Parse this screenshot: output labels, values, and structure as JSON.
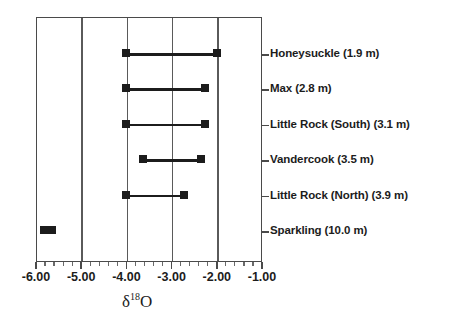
{
  "chart_data": {
    "type": "bar",
    "subtype": "horizontal-range",
    "title": "",
    "xlabel": "δ¹⁸O",
    "xlabel_base": "δ",
    "xlabel_superscript": "18",
    "xlabel_element": "O",
    "ylabel": "",
    "xlim": [
      -6.0,
      -1.0
    ],
    "xticks": [
      -6.0,
      -5.0,
      -4.0,
      -3.0,
      -2.0,
      -1.0
    ],
    "xtick_labels": [
      "-6.00",
      "-5.00",
      "-4.00",
      "-3.00",
      "-2.00",
      "-1.00"
    ],
    "minor_ticks_per_interval": 4,
    "grid": true,
    "grid_axis": "x",
    "legend": false,
    "categories": [
      "Honeysuckle (1.9 m)",
      "Max  (2.8 m)",
      "Little Rock (South) (3.1 m)",
      "Vandercook (3.5 m)",
      "Little Rock (North)  (3.9 m)",
      "Sparkling  (10.0 m)"
    ],
    "series": [
      {
        "name": "delta-18-O range",
        "ranges": [
          {
            "label": "Honeysuckle (1.9 m)",
            "lake": "Honeysuckle",
            "depth_m": 1.9,
            "min": -4.0,
            "max": -2.0
          },
          {
            "label": "Max  (2.8 m)",
            "lake": "Max",
            "depth_m": 2.8,
            "min": -4.0,
            "max": -2.27
          },
          {
            "label": "Little Rock (South) (3.1 m)",
            "lake": "Little Rock (South)",
            "depth_m": 3.1,
            "min": -4.0,
            "max": -2.27
          },
          {
            "label": "Vandercook (3.5 m)",
            "lake": "Vandercook",
            "depth_m": 3.5,
            "min": -3.64,
            "max": -2.36
          },
          {
            "label": "Little Rock (North)  (3.9 m)",
            "lake": "Little Rock (North)",
            "depth_m": 3.9,
            "min": -4.0,
            "max": -2.73
          },
          {
            "label": "Sparkling  (10.0 m)",
            "lake": "Sparkling",
            "depth_m": 10.0,
            "min": -5.82,
            "max": -5.64
          }
        ]
      }
    ],
    "colors": {
      "marker": "#1c1c1c",
      "line": "#1c1c1c",
      "frame": "#4a4a4a",
      "grid": "#5a5a5a",
      "text": "#1c1c1c",
      "background": "#ffffff"
    }
  }
}
